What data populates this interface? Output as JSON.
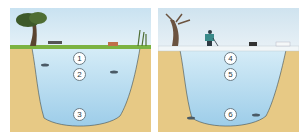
{
  "panels": [
    {
      "season": "summer",
      "markers": [
        {
          "label": "1",
          "x": 70,
          "y": 51
        },
        {
          "label": "2",
          "x": 70,
          "y": 67
        },
        {
          "label": "3",
          "x": 70,
          "y": 107
        }
      ]
    },
    {
      "season": "winter",
      "markers": [
        {
          "label": "4",
          "x": 73,
          "y": 51
        },
        {
          "label": "5",
          "x": 73,
          "y": 67
        },
        {
          "label": "6",
          "x": 73,
          "y": 107
        }
      ]
    }
  ],
  "colors": {
    "sky_summer": "#cfe6f3",
    "sky_winter": "#dde9f1",
    "water_top": "#cde7f4",
    "water_bottom": "#9fcfea",
    "soil": "#e7c985",
    "grass": "#7cb342",
    "ice": "#f1f6f8"
  }
}
